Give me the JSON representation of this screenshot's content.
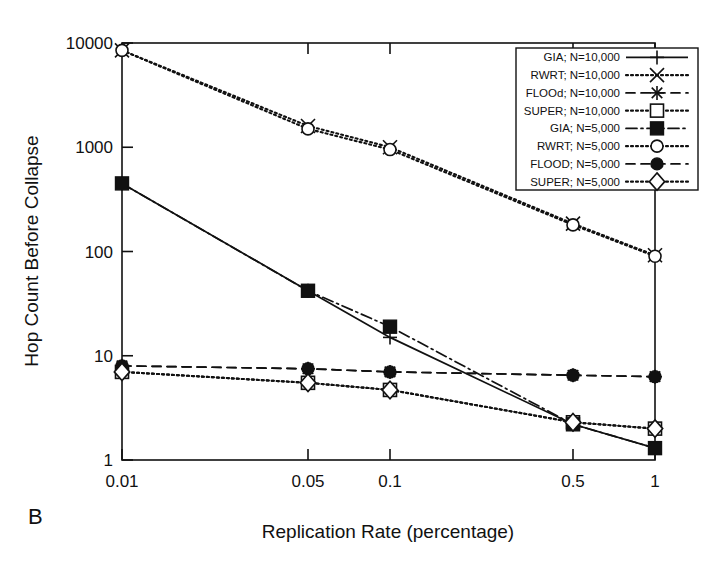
{
  "figure": {
    "panel_label": "B",
    "background_color": "#ffffff",
    "ink_color": "#111111"
  },
  "chart_data": {
    "type": "line",
    "title": "",
    "subtitle": "",
    "panel": "B",
    "xlabel": "Replication Rate (percentage)",
    "ylabel": "Hop Count Before Collapse",
    "xscale": "log",
    "yscale": "log",
    "xlim": [
      0.01,
      1
    ],
    "ylim": [
      1,
      10000
    ],
    "grid": false,
    "legend_position": "upper-right-inside",
    "x": [
      0.01,
      0.05,
      0.1,
      0.5,
      1
    ],
    "xtick_labels": [
      "0.01",
      "0.05",
      "0.1",
      "0.5",
      "1"
    ],
    "ytick_labels": [
      "1",
      "10",
      "100",
      "1000",
      "10000"
    ],
    "yticks": [
      1,
      10,
      100,
      1000,
      10000
    ],
    "series": [
      {
        "name": "GIA; N=10,000",
        "marker": "plus",
        "linestyle": "solid",
        "values": [
          450,
          42,
          15,
          2.2,
          1.3
        ]
      },
      {
        "name": "RWRT; N=10,000",
        "marker": "cross",
        "linestyle": "dotted",
        "values": [
          8500,
          1600,
          1000,
          185,
          92
        ]
      },
      {
        "name": "FLOOd; N=10,000",
        "marker": "asterisk",
        "linestyle": "dashed",
        "values": [
          8,
          7.5,
          7,
          6.5,
          6.3
        ]
      },
      {
        "name": "SUPER; N=10,000",
        "marker": "open-square",
        "linestyle": "dotted",
        "values": [
          7,
          5.5,
          4.7,
          2.3,
          2.0
        ]
      },
      {
        "name": "GIA; N=5,000",
        "marker": "filled-square",
        "linestyle": "dash-dot",
        "values": [
          450,
          42,
          19,
          2.2,
          1.3
        ]
      },
      {
        "name": "RWRT; N=5,000",
        "marker": "open-circle",
        "linestyle": "dotted",
        "values": [
          8500,
          1500,
          950,
          180,
          90
        ]
      },
      {
        "name": "FLOOD; N=5,000",
        "marker": "filled-circle",
        "linestyle": "dashed",
        "values": [
          8,
          7.5,
          7,
          6.5,
          6.3
        ]
      },
      {
        "name": "SUPER; N=5,000",
        "marker": "open-diamond",
        "linestyle": "dotted",
        "values": [
          7,
          5.5,
          4.7,
          2.3,
          2.0
        ]
      }
    ],
    "legend_entries": [
      "GIA; N=10,000",
      "RWRT; N=10,000",
      "FLOOd; N=10,000",
      "SUPER; N=10,000",
      "GIA; N=5,000",
      "RWRT; N=5,000",
      "FLOOD; N=5,000",
      "SUPER; N=5,000"
    ]
  }
}
